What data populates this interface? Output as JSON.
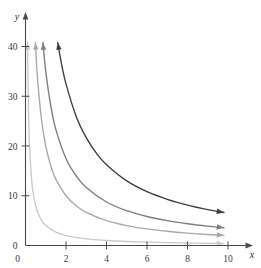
{
  "chart_data": {
    "type": "line",
    "title": "",
    "subtitle": "",
    "xlabel": "x",
    "ylabel": "y",
    "xlim": [
      0,
      10.6
    ],
    "ylim": [
      0,
      43
    ],
    "grid": false,
    "legend": null,
    "x_ticks": [
      0,
      2,
      4,
      6,
      8,
      10
    ],
    "x_tick_labels": [
      "0",
      "2",
      "4",
      "6",
      "8",
      "10"
    ],
    "y_ticks": [
      0,
      10,
      20,
      30,
      40
    ],
    "y_tick_labels": [
      "0",
      "10",
      "20",
      "30",
      "40"
    ],
    "annotations": [
      "each curve has an arrowhead at both ends",
      "curves are hyperbolas of the form y = k / x"
    ],
    "series": [
      {
        "name": "y = 4/x",
        "k": 4,
        "color": "#c9c9c9",
        "x": [
          0.098,
          0.15,
          0.2,
          0.3,
          0.4,
          0.5,
          0.6,
          0.8,
          1.0,
          1.5,
          2.0,
          3.0,
          4.0,
          5.0,
          6.0,
          7.0,
          8.0,
          9.0,
          9.8
        ],
        "y": [
          40.8,
          26.7,
          20.0,
          13.3,
          10.0,
          8.0,
          6.67,
          5.0,
          4.0,
          2.67,
          2.0,
          1.33,
          1.0,
          0.8,
          0.67,
          0.57,
          0.5,
          0.44,
          0.41
        ]
      },
      {
        "name": "y = 20/x",
        "k": 20,
        "color": "#a8a8a8",
        "x": [
          0.49,
          0.6,
          0.8,
          1.0,
          1.25,
          1.5,
          2.0,
          2.5,
          3.0,
          4.0,
          5.0,
          6.0,
          7.0,
          8.0,
          9.0,
          9.8
        ],
        "y": [
          40.8,
          33.3,
          25.0,
          20.0,
          16.0,
          13.3,
          10.0,
          8.0,
          6.67,
          5.0,
          4.0,
          3.33,
          2.86,
          2.5,
          2.22,
          2.04
        ]
      },
      {
        "name": "y = 35/x",
        "k": 35,
        "color": "#7d7d7d",
        "x": [
          0.858,
          1.0,
          1.25,
          1.5,
          2.0,
          2.5,
          3.0,
          4.0,
          5.0,
          6.0,
          7.0,
          8.0,
          9.0,
          9.8
        ],
        "y": [
          40.8,
          35.0,
          28.0,
          23.3,
          17.5,
          14.0,
          11.67,
          8.75,
          7.0,
          5.83,
          5.0,
          4.38,
          3.89,
          3.57
        ]
      },
      {
        "name": "y = 65/x",
        "k": 65,
        "color": "#3d3d3d",
        "x": [
          1.593,
          1.75,
          2.0,
          2.5,
          3.0,
          3.5,
          4.0,
          5.0,
          6.0,
          7.0,
          8.0,
          9.0,
          9.8
        ],
        "y": [
          40.8,
          37.1,
          32.5,
          26.0,
          21.67,
          18.57,
          16.25,
          13.0,
          10.83,
          9.29,
          8.13,
          7.22,
          6.63
        ]
      }
    ]
  },
  "axes": {
    "y_axis_label": "y",
    "x_axis_label": "x"
  },
  "colors": {
    "axis": "#4a4a4a",
    "tick_text": "#3a3a3a",
    "curve_1": "#c9c9c9",
    "curve_2": "#a8a8a8",
    "curve_3": "#7d7d7d",
    "curve_4": "#3d3d3d"
  }
}
